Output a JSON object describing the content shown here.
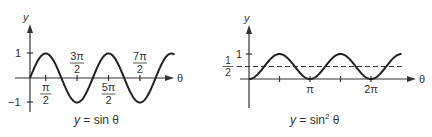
{
  "chart_data": [
    {
      "type": "line",
      "title": "y = sin θ",
      "xlabel": "θ",
      "ylabel": "y",
      "function": "sin(theta)",
      "x_range": [
        0,
        9.2
      ],
      "x_units": "π/2",
      "ylim": [
        -1,
        1
      ],
      "grid": false,
      "y_ticks": [
        "1",
        "−1"
      ],
      "y_tick_values": [
        1,
        -1
      ],
      "x_ticks": [
        {
          "num": "π",
          "den": "2",
          "value_in_halfpi": 1,
          "position": "below"
        },
        {
          "num": "3π",
          "den": "2",
          "value_in_halfpi": 3,
          "position": "above"
        },
        {
          "num": "5π",
          "den": "2",
          "value_in_halfpi": 5,
          "position": "below"
        },
        {
          "num": "7π",
          "den": "2",
          "value_in_halfpi": 7,
          "position": "above"
        }
      ],
      "caption_y": "y",
      "caption_eq": " = sin θ"
    },
    {
      "type": "line",
      "title": "y = sin² θ",
      "xlabel": "θ",
      "ylabel": "y",
      "function": "sin(theta)^2",
      "x_range_pi": [
        0,
        2.5
      ],
      "ylim": [
        0,
        1
      ],
      "grid": false,
      "y_ticks": [
        "1"
      ],
      "y_tick_values": [
        1
      ],
      "reference_line": {
        "value": 0.5,
        "style": "dashed",
        "label_num": "1",
        "label_den": "2"
      },
      "x_ticks": [
        {
          "label": "π",
          "value_pi": 1
        },
        {
          "label": "2π",
          "value_pi": 2
        }
      ],
      "minor_ticks_pi": [
        0.5,
        1.5
      ],
      "caption_y": "y",
      "caption_eq_pre": " = sin",
      "caption_sup": "2",
      "caption_eq_post": " θ"
    }
  ]
}
